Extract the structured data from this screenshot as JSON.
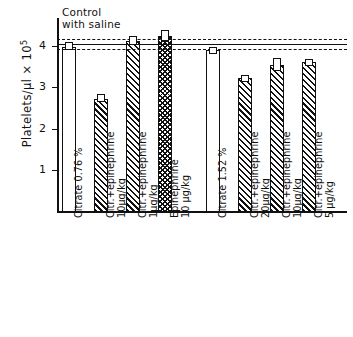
{
  "annotation": {
    "line1": "Control",
    "line2": "with saline"
  },
  "axes": {
    "ylabel_text": "Platelets/µl × 10",
    "ylabel_exp": "5",
    "yticks": [
      "1",
      "2",
      "3",
      "4"
    ]
  },
  "chart_data": {
    "type": "bar",
    "title": "",
    "xlabel": "",
    "ylabel": "Platelets/µl × 10⁵",
    "ylim": [
      0,
      4.6
    ],
    "grid": false,
    "legend": "none",
    "categories": [
      "Citrate 0.76 %",
      "Citr.+epinephrine\n10µg/kg",
      "Citr.+epinephrine\n1µg/kg",
      "Epinephrine\n10 µg/kg",
      "Citrate 1.52 %",
      "Citr.+epinephrine\n20µg/kg",
      "Citr.+epinephrine\n10µg/kg",
      "Citr.+epinephrine\n5 µg/kg"
    ],
    "values": [
      3.98,
      2.73,
      4.12,
      4.25,
      3.9,
      3.22,
      3.55,
      3.62
    ],
    "errors": [
      0.1,
      0.09,
      0.1,
      0.13,
      0.07,
      0.07,
      0.16,
      0.06
    ],
    "fills": [
      "open",
      "hatch",
      "hatch",
      "cross",
      "open",
      "hatch",
      "hatch",
      "hatch"
    ],
    "reference_lines": [
      {
        "value": 4.15,
        "style": "dashed"
      },
      {
        "value": 4.03,
        "style": "solid"
      },
      {
        "value": 3.92,
        "style": "dashed"
      }
    ],
    "reference_label": "Control with saline"
  }
}
